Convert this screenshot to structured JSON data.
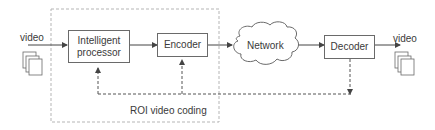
{
  "diagram": {
    "input_label": "video",
    "output_label": "video",
    "nodes": {
      "intelligent_processor": "Intelligent\nprocessor",
      "encoder": "Encoder",
      "network": "Network",
      "decoder": "Decoder"
    },
    "group_label": "ROI video coding",
    "icons": {
      "input": "video-frames-stack",
      "output": "video-frames-stack"
    },
    "colors": {
      "stroke": "#6a6a6a",
      "dashed": "#8a8a8a",
      "group_border": "#b5b5b5",
      "text": "#3a3a3a"
    }
  }
}
